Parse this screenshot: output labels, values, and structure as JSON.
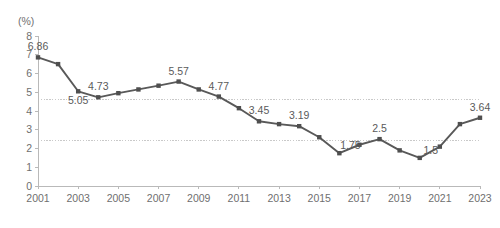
{
  "chart_data": {
    "type": "line",
    "title": "",
    "subtitle": "",
    "xlabel": "",
    "ylabel": "",
    "unit_label": "(%)",
    "grid": true,
    "legend": false,
    "legend_position": "none",
    "xlim": [
      2001,
      2023
    ],
    "ylim": [
      0,
      8
    ],
    "y_ticks": [
      "8",
      "7",
      "6",
      "5",
      "4",
      "3",
      "2",
      "1",
      "0"
    ],
    "y_tick_values": [
      8,
      7,
      6,
      5,
      4,
      3,
      2,
      1,
      0
    ],
    "x_tick_labels": [
      "2001",
      "2003",
      "2005",
      "2007",
      "2009",
      "2011",
      "2013",
      "2015",
      "2017",
      "2019",
      "2021",
      "2023"
    ],
    "x_tick_values": [
      2001,
      2003,
      2005,
      2007,
      2009,
      2011,
      2013,
      2015,
      2017,
      2019,
      2021,
      2023
    ],
    "x": [
      2001,
      2002,
      2003,
      2004,
      2005,
      2006,
      2007,
      2008,
      2009,
      2010,
      2011,
      2012,
      2013,
      2014,
      2015,
      2016,
      2017,
      2018,
      2019,
      2020,
      2021,
      2022,
      2023
    ],
    "values": [
      6.86,
      6.5,
      5.05,
      4.73,
      4.95,
      5.15,
      5.35,
      5.57,
      5.15,
      4.77,
      4.15,
      3.45,
      3.3,
      3.19,
      2.6,
      1.75,
      2.2,
      2.5,
      1.9,
      1.5,
      2.1,
      3.3,
      3.64
    ],
    "point_labels": [
      {
        "x": 2001,
        "y": 6.86,
        "text": "6.86",
        "position": "above"
      },
      {
        "x": 2003,
        "y": 5.05,
        "text": "5.05",
        "position": "below"
      },
      {
        "x": 2004,
        "y": 4.73,
        "text": "4.73",
        "position": "above"
      },
      {
        "x": 2008,
        "y": 5.57,
        "text": "5.57",
        "position": "above"
      },
      {
        "x": 2010,
        "y": 4.77,
        "text": "4.77",
        "position": "above"
      },
      {
        "x": 2012,
        "y": 3.45,
        "text": "3.45",
        "position": "above"
      },
      {
        "x": 2014,
        "y": 3.19,
        "text": "3.19",
        "position": "above"
      },
      {
        "x": 2016,
        "y": 1.75,
        "text": "1.75",
        "position": "above-right"
      },
      {
        "x": 2018,
        "y": 2.5,
        "text": "2.5",
        "position": "above"
      },
      {
        "x": 2020,
        "y": 1.5,
        "text": "1.5",
        "position": "above-right"
      },
      {
        "x": 2023,
        "y": 3.64,
        "text": "3.64",
        "position": "above"
      }
    ],
    "reference_lines": [
      {
        "value": 4.6,
        "style": "dotted"
      },
      {
        "value": 2.45,
        "style": "dotted"
      }
    ],
    "colors": {
      "line": "#595959",
      "marker": "#4f4f4f",
      "axis": "#b9b9b9",
      "gridline": "#c9c9c9",
      "tick_text": "#6f6f6f",
      "value_text": "#5a5a5a",
      "background": "#ffffff"
    }
  }
}
